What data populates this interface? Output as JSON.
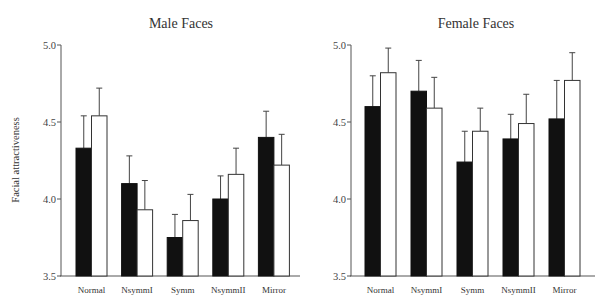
{
  "chart_data": [
    {
      "type": "bar",
      "title": "Male Faces",
      "xlabel": "",
      "ylabel": "Facial attractiveness",
      "ylim": [
        3.5,
        5.0
      ],
      "yticks": [
        "3.5",
        "4.0",
        "4.5",
        "5.0"
      ],
      "categories": [
        "Normal",
        "NsymmI",
        "Symm",
        "NsymmII",
        "Mirror"
      ],
      "series": [
        {
          "name": "black",
          "color": "#111111",
          "values": [
            4.33,
            4.1,
            3.75,
            4.0,
            4.4
          ],
          "error_upper": [
            4.54,
            4.28,
            3.9,
            4.15,
            4.57
          ]
        },
        {
          "name": "white",
          "color": "#ffffff",
          "values": [
            4.54,
            3.93,
            3.86,
            4.16,
            4.22
          ],
          "error_upper": [
            4.72,
            4.12,
            4.03,
            4.33,
            4.42
          ]
        }
      ],
      "grid": false,
      "legend": null
    },
    {
      "type": "bar",
      "title": "Female Faces",
      "xlabel": "",
      "ylabel": "",
      "ylim": [
        3.5,
        5.0
      ],
      "yticks": [
        "3.5",
        "4.0",
        "4.5",
        "5.0"
      ],
      "categories": [
        "Normal",
        "NsymmI",
        "Symm",
        "NsymmII",
        "Mirror"
      ],
      "series": [
        {
          "name": "black",
          "color": "#111111",
          "values": [
            4.6,
            4.7,
            4.24,
            4.39,
            4.52
          ],
          "error_upper": [
            4.8,
            4.9,
            4.44,
            4.55,
            4.77
          ]
        },
        {
          "name": "white",
          "color": "#ffffff",
          "values": [
            4.82,
            4.59,
            4.44,
            4.49,
            4.77
          ],
          "error_upper": [
            4.98,
            4.79,
            4.59,
            4.68,
            4.95
          ]
        }
      ],
      "grid": false,
      "legend": null
    }
  ]
}
